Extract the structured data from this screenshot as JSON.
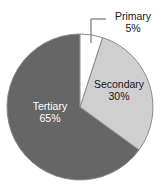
{
  "chart_data": {
    "type": "pie",
    "title": "",
    "categories": [
      "Primary",
      "Secondary",
      "Tertiary"
    ],
    "values": [
      5,
      30,
      65
    ],
    "value_unit": "%",
    "labels": [
      "5%",
      "30%",
      "65%"
    ],
    "legend": "none",
    "grid": false,
    "slice_colors": [
      "#ffffff",
      "#cfcfcf",
      "#666666"
    ],
    "slice_label_colors": [
      "#161616",
      "#161616",
      "#ffffff"
    ],
    "start_angle_deg": 0,
    "direction": "clockwise",
    "slices": [
      {
        "name": "Primary",
        "value": 5,
        "label": "5%",
        "color": "#ffffff",
        "label_placement": "outside-callout"
      },
      {
        "name": "Secondary",
        "value": 30,
        "label": "30%",
        "color": "#cfcfcf",
        "label_placement": "inside"
      },
      {
        "name": "Tertiary",
        "value": 65,
        "label": "65%",
        "color": "#666666",
        "label_placement": "inside"
      }
    ]
  },
  "geometry": {
    "center_x": 80,
    "center_y": 107,
    "radius": 73,
    "outline_color": "#8a8a8a",
    "leader_line_color": "#5a5a5a"
  }
}
